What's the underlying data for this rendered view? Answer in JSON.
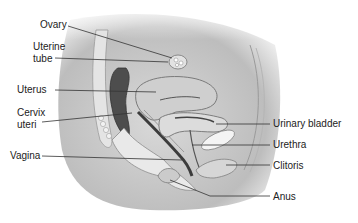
{
  "diagram": {
    "labels_left": [
      {
        "id": "ovary",
        "text": "Ovary"
      },
      {
        "id": "uterine_tube_1",
        "text": "Uterine"
      },
      {
        "id": "uterine_tube_2",
        "text": "tube"
      },
      {
        "id": "uterus",
        "text": "Uterus"
      },
      {
        "id": "cervix_1",
        "text": "Cervix"
      },
      {
        "id": "cervix_2",
        "text": "uteri"
      },
      {
        "id": "vagina",
        "text": "Vagina"
      }
    ],
    "labels_right": [
      {
        "id": "urinary_bladder",
        "text": "Urinary bladder"
      },
      {
        "id": "urethra",
        "text": "Urethra"
      },
      {
        "id": "clitoris",
        "text": "Clitoris"
      },
      {
        "id": "anus",
        "text": "Anus"
      }
    ],
    "colors": {
      "background": "#ffffff",
      "body_shade": "#c8c8c8",
      "tissue_light": "#e6e6e6",
      "tissue_dark": "#5a5a5a",
      "leader_line": "#333333",
      "text": "#222222"
    }
  }
}
